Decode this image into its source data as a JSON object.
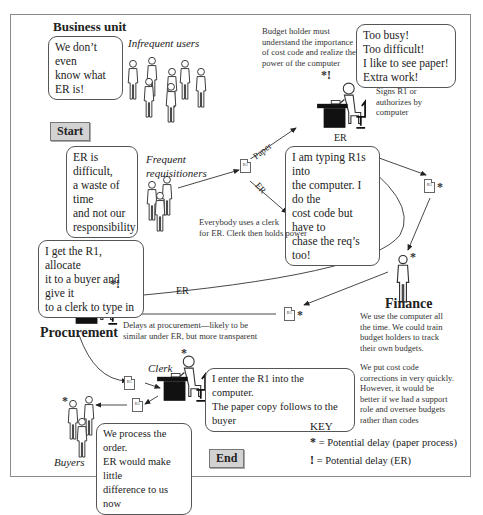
{
  "sections": {
    "business_unit": "Business unit",
    "start": "Start",
    "end": "End",
    "procurement": "Procurement",
    "finance": "Finance"
  },
  "actors": {
    "infrequent_users": "Infrequent users",
    "frequent_requisitioners_line1": "Frequent",
    "frequent_requisitioners_line2": "requisitioners",
    "budget_holder": "Budget holder",
    "clerk_top": "Clerk",
    "clerk_bottom": "Clerk",
    "buyers": "Buyers"
  },
  "bubbles": {
    "infrequent_line1": "We don’t even",
    "infrequent_line2": "know what ER is!",
    "frequent_line1": "ER is difficult,",
    "frequent_line2": "a waste of time",
    "frequent_line3": "and not our",
    "frequent_line4": "responsibility",
    "budget_line1": "Too busy!",
    "budget_line2": "Too difficult!",
    "budget_line3": "I like to see paper!",
    "budget_line4": "Extra work!",
    "clerk_line1": "I am typing R1s into",
    "clerk_line2": "the computer. I do the",
    "clerk_line3": "cost code but have to",
    "clerk_line4": "chase the req’s too!",
    "procurement_line1": "I get the R1, allocate",
    "procurement_line2": "it to a buyer and give it",
    "procurement_line3": "to a clerk to type in",
    "clerk2_line1": "I enter the R1 into the computer.",
    "clerk2_line2": "The paper copy follows to the buyer",
    "buyers_line1": "We process the order.",
    "buyers_line2": "ER would make little",
    "buyers_line3": "difference to us now"
  },
  "notes": {
    "budget_holder_need_1": "Budget holder must",
    "budget_holder_need_2": "understand the importance",
    "budget_holder_need_3": "of cost code and realize the",
    "budget_holder_need_4": "power of the computer",
    "budget_holder_role_1": "Signs R1 or",
    "budget_holder_role_2": "authorizes by",
    "budget_holder_role_3": "computer",
    "clerk_power_1": "Everybody uses a clerk",
    "clerk_power_2": "for ER. Clerk then holds power",
    "procurement_delay_1": "Delays at procurement—likely to be",
    "procurement_delay_2": "similar under ER, but more transparent",
    "finance_1": "We use the computer all",
    "finance_2": "the time. We could train",
    "finance_3": "budget holders to track",
    "finance_4": "their own budgets.",
    "finance_5": "We put cost code",
    "finance_6": "corrections in very quickly.",
    "finance_7": "However, it would be",
    "finance_8": "better if we had a support",
    "finance_9": "role and oversee budgets",
    "finance_10": "rather than codes"
  },
  "arrow_labels": {
    "paper": "Paper",
    "er_to_clerk": "ER",
    "er_under_budget": "ER",
    "er_to_procurement": "ER"
  },
  "documents": {
    "r1": "R1"
  },
  "markers": {
    "star": "*",
    "bang": "!",
    "star_bang": "*!"
  },
  "key": {
    "title": "KEY",
    "star_symbol": "*",
    "star_text": "= Potential delay (paper process)",
    "bang_symbol": "!",
    "bang_text": "=  Potential delay (ER)"
  },
  "colors": {
    "frame": "#8a8a8a",
    "tag_fill": "#d2d2d2",
    "desk": "#111111",
    "line": "#333333"
  }
}
